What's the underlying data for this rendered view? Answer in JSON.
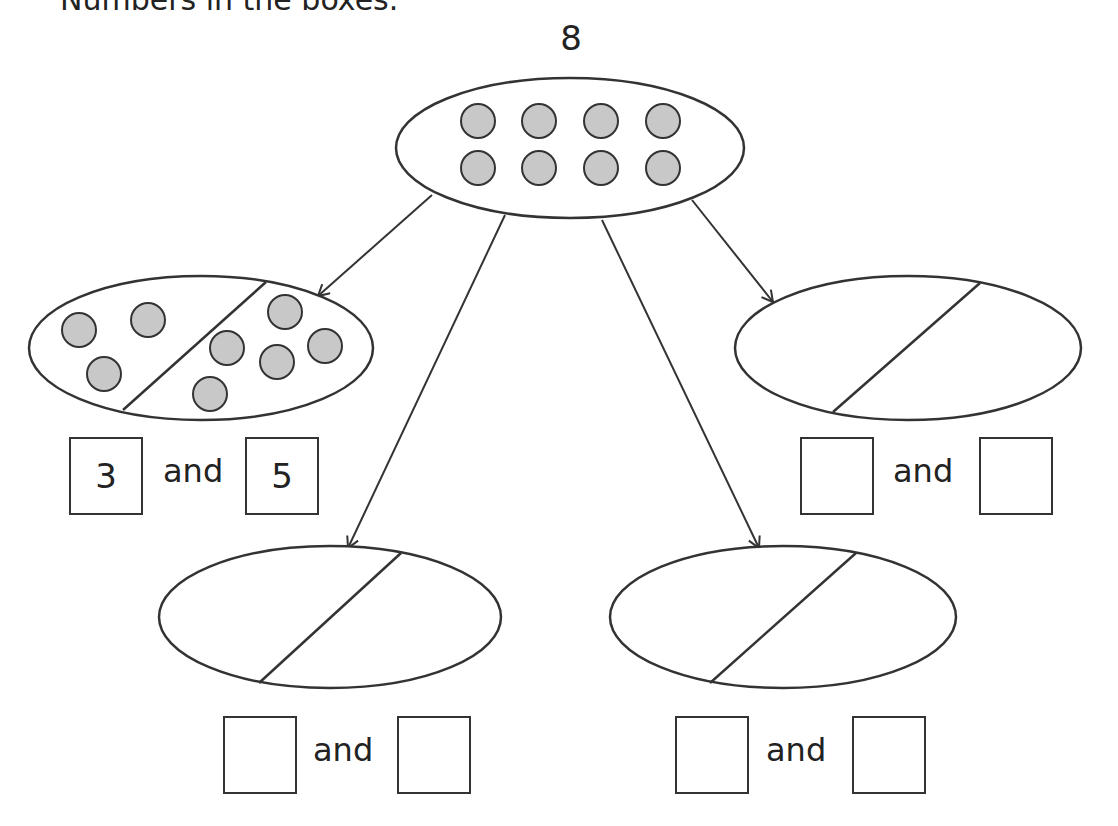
{
  "instruction_fragment": "Numbers in the boxes.",
  "total": "8",
  "and_word": "and",
  "colors": {
    "stroke": "#333333",
    "dot_fill": "#c8c8c8",
    "background": "#ffffff"
  },
  "top_group": {
    "dot_count": 8
  },
  "partitions": [
    {
      "id": "top-left",
      "left_value": "3",
      "right_value": "5",
      "left_dots": 3,
      "right_dots": 5
    },
    {
      "id": "top-right",
      "left_value": "",
      "right_value": ""
    },
    {
      "id": "bottom-left",
      "left_value": "",
      "right_value": ""
    },
    {
      "id": "bottom-right",
      "left_value": "",
      "right_value": ""
    }
  ]
}
